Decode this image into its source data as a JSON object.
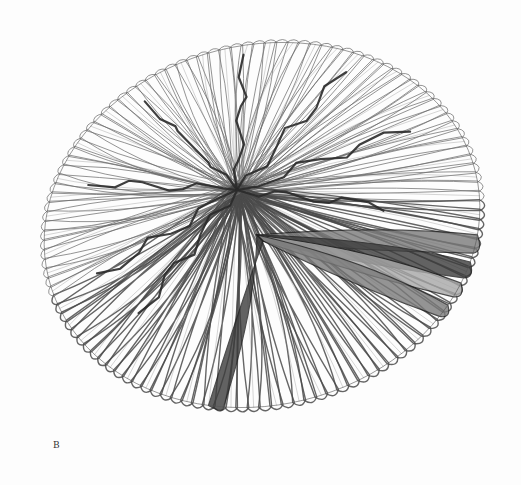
{
  "figure": {
    "panel_label": "B",
    "colors": {
      "background": "#fdfdfd",
      "ink": "#2a2a2a",
      "stroke_light": "#6a6a6a",
      "shade_dark": "#3c3c3c",
      "shade_mid": "#7a7a7a",
      "shade_light": "#a8a8a8"
    },
    "center": [
      237,
      190
    ],
    "outline": {
      "cx": 262,
      "cy": 225,
      "rx": 220,
      "ry": 180,
      "rotate": -14
    }
  }
}
